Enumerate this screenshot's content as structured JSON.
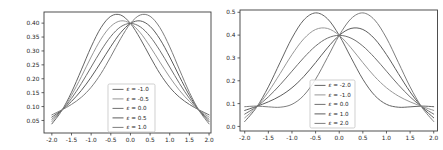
{
  "figure": {
    "background": "#ffffff"
  },
  "chart_data": [
    {
      "type": "line",
      "title": "",
      "xlabel": "",
      "ylabel": "",
      "xlim": [
        -2.2,
        2.05
      ],
      "ylim": [
        0.005,
        0.44
      ],
      "grid": false,
      "legend_position": "lower center-right inside",
      "xticks": [
        -2.0,
        -1.5,
        -1.0,
        -0.5,
        0.0,
        0.5,
        1.0,
        1.5,
        2.0
      ],
      "xtick_labels": [
        "-2.0",
        "-1.5",
        "-1.0",
        "-0.5",
        "0.0",
        "0.5",
        "1.0",
        "1.5",
        "2.0"
      ],
      "yticks": [
        0.05,
        0.1,
        0.15,
        0.2,
        0.25,
        0.3,
        0.35,
        0.4
      ],
      "ytick_labels": [
        "0.05",
        "0.10",
        "0.15",
        "0.20",
        "0.25",
        "0.30",
        "0.35",
        "0.40"
      ],
      "x": [
        -2.0,
        -1.75,
        -1.5,
        -1.25,
        -1.0,
        -0.75,
        -0.5,
        -0.25,
        0.0,
        0.25,
        0.5,
        0.75,
        1.0,
        1.25,
        1.5,
        1.75,
        2.0
      ],
      "series": [
        {
          "label": "ε = -1.0",
          "epsilon": -1.0,
          "color": "#646464",
          "y": [
            0.0378,
            0.0849,
            0.1514,
            0.2319,
            0.3146,
            0.3837,
            0.4247,
            0.4293,
            0.3989,
            0.3441,
            0.2795,
            0.2186,
            0.1694,
            0.1334,
            0.1077,
            0.0877,
            0.0702
          ]
        },
        {
          "label": "ε = -0.5",
          "epsilon": -0.5,
          "color": "#989898",
          "y": [
            0.0459,
            0.0856,
            0.1405,
            0.2073,
            0.2783,
            0.3424,
            0.3884,
            0.408,
            0.3989,
            0.3654,
            0.3158,
            0.2599,
            0.2057,
            0.158,
            0.1186,
            0.087,
            0.0621
          ]
        },
        {
          "label": "ε = 0.0",
          "epsilon": 0.0,
          "color": "#707070",
          "y": [
            0.054,
            0.0863,
            0.1295,
            0.1827,
            0.242,
            0.3011,
            0.3521,
            0.3867,
            0.3989,
            0.3867,
            0.3521,
            0.3011,
            0.242,
            0.1827,
            0.1295,
            0.0863,
            0.054
          ]
        },
        {
          "label": "ε = 0.5",
          "epsilon": 0.5,
          "color": "#5c5c5c",
          "y": [
            0.0621,
            0.087,
            0.1186,
            0.158,
            0.2057,
            0.2599,
            0.3158,
            0.3654,
            0.3989,
            0.408,
            0.3884,
            0.3424,
            0.2783,
            0.2073,
            0.1405,
            0.0856,
            0.0459
          ]
        },
        {
          "label": "ε = 1.0",
          "epsilon": 1.0,
          "color": "#7e7e7e",
          "y": [
            0.0702,
            0.0877,
            0.1077,
            0.1334,
            0.1694,
            0.2186,
            0.2795,
            0.3441,
            0.3989,
            0.4293,
            0.4247,
            0.3837,
            0.3146,
            0.2319,
            0.1514,
            0.0849,
            0.0378
          ]
        }
      ]
    },
    {
      "type": "line",
      "title": "",
      "xlabel": "",
      "ylabel": "",
      "xlim": [
        -2.1,
        2.08
      ],
      "ylim": [
        -0.02,
        0.51
      ],
      "grid": false,
      "legend_position": "lower center-right inside",
      "xticks": [
        -2.0,
        -1.5,
        -1.0,
        -0.5,
        0.0,
        0.5,
        1.0,
        1.5,
        2.0
      ],
      "xtick_labels": [
        "-2.0",
        "-1.5",
        "-1.0",
        "-0.5",
        "0.0",
        "0.5",
        "1.0",
        "1.5",
        "2.0"
      ],
      "yticks": [
        0.0,
        0.1,
        0.2,
        0.3,
        0.4,
        0.5
      ],
      "ytick_labels": [
        "0.0",
        "0.1",
        "0.2",
        "0.3",
        "0.4",
        "0.5"
      ],
      "x": [
        -2.0,
        -1.75,
        -1.5,
        -1.25,
        -1.0,
        -0.75,
        -0.5,
        -0.25,
        0.0,
        0.25,
        0.5,
        0.75,
        1.0,
        1.25,
        1.5,
        1.75,
        2.0
      ],
      "series": [
        {
          "label": "ε = -2.0",
          "epsilon": -2.0,
          "color": "#646464",
          "y": [
            0.0216,
            0.0835,
            0.1732,
            0.2811,
            0.3872,
            0.4663,
            0.4973,
            0.4719,
            0.3989,
            0.3015,
            0.2068,
            0.136,
            0.0968,
            0.0842,
            0.0858,
            0.0891,
            0.0864
          ]
        },
        {
          "label": "ε = -1.0",
          "epsilon": -1.0,
          "color": "#989898",
          "y": [
            0.0378,
            0.0849,
            0.1514,
            0.2319,
            0.3146,
            0.3837,
            0.4247,
            0.4293,
            0.3989,
            0.3441,
            0.2795,
            0.2186,
            0.1694,
            0.1334,
            0.1077,
            0.0877,
            0.0702
          ]
        },
        {
          "label": "ε = 0.0",
          "epsilon": 0.0,
          "color": "#707070",
          "y": [
            0.054,
            0.0863,
            0.1295,
            0.1827,
            0.242,
            0.3011,
            0.3521,
            0.3867,
            0.3989,
            0.3867,
            0.3521,
            0.3011,
            0.242,
            0.1827,
            0.1295,
            0.0863,
            0.054
          ]
        },
        {
          "label": "ε = 1.0",
          "epsilon": 1.0,
          "color": "#5c5c5c",
          "y": [
            0.0702,
            0.0877,
            0.1077,
            0.1334,
            0.1694,
            0.2186,
            0.2795,
            0.3441,
            0.3989,
            0.4293,
            0.4247,
            0.3837,
            0.3146,
            0.2319,
            0.1514,
            0.0849,
            0.0378
          ]
        },
        {
          "label": "ε = 2.0",
          "epsilon": 2.0,
          "color": "#7e7e7e",
          "y": [
            0.0864,
            0.0891,
            0.0858,
            0.0842,
            0.0968,
            0.136,
            0.2068,
            0.3015,
            0.3989,
            0.4719,
            0.4973,
            0.4663,
            0.3872,
            0.2811,
            0.1732,
            0.0835,
            0.0216
          ]
        }
      ]
    }
  ],
  "style": {
    "spine_color": "#3c3c3c",
    "tick_color": "#3c3c3c",
    "text_color": "#1c1c1c",
    "legend_border_color": "#bbbbbb",
    "legend_fill": "rgba(255,255,255,0.85)"
  }
}
